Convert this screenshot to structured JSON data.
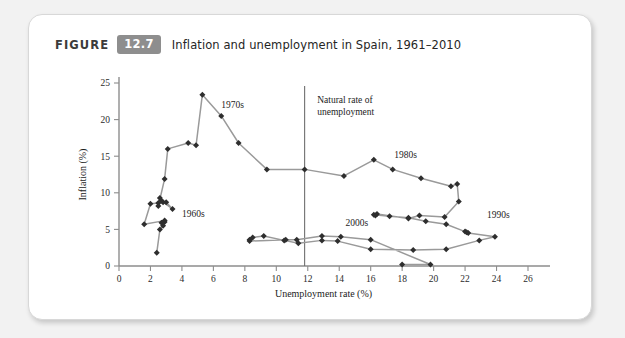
{
  "caption": {
    "figure_word": "FIGURE",
    "figure_number": "12.7",
    "title": "Inflation and unemployment in Spain, 1961–2010"
  },
  "colors": {
    "card_background": "#ffffff",
    "page_background": "#f2f2f2",
    "badge": "#8e8e8e",
    "line": "#9a9a9a",
    "marker": "#2e2e2e",
    "axis": "#8d8d8d",
    "natural_rate_line": "#6f6f6f"
  },
  "chart_data": {
    "type": "line",
    "title": "Inflation and unemployment in Spain, 1961–2010",
    "xlabel": "Unemployment rate (%)",
    "ylabel": "Inflation (%)",
    "xlim": [
      0,
      26
    ],
    "ylim": [
      0,
      25
    ],
    "xticks": [
      0,
      2,
      4,
      6,
      8,
      10,
      12,
      14,
      16,
      18,
      20,
      22,
      24,
      26
    ],
    "yticks": [
      0,
      5,
      10,
      15,
      20,
      25
    ],
    "grid": false,
    "legend": "none",
    "annotations": [
      {
        "text": "1970s",
        "x": 6.5,
        "y": 21.6
      },
      {
        "text": "Natural rate of",
        "x": 12.6,
        "y": 22.2
      },
      {
        "text": "unemployment",
        "x": 12.6,
        "y": 20.6
      },
      {
        "text": "1960s",
        "x": 4.0,
        "y": 6.7
      },
      {
        "text": "1980s",
        "x": 17.5,
        "y": 14.8
      },
      {
        "text": "1990s",
        "x": 23.4,
        "y": 6.5
      },
      {
        "text": "2000s",
        "x": 14.4,
        "y": 5.4
      }
    ],
    "natural_rate": {
      "x": 11.8,
      "label": "Natural rate of unemployment"
    },
    "series": [
      {
        "name": "Spain inflation vs unemployment, 1961-2010",
        "points": [
          [
            2.4,
            1.8
          ],
          [
            2.6,
            5.0
          ],
          [
            2.8,
            5.5
          ],
          [
            2.7,
            5.9
          ],
          [
            2.9,
            6.0
          ],
          [
            2.9,
            6.2
          ],
          [
            1.6,
            5.7
          ],
          [
            2.0,
            8.5
          ],
          [
            2.5,
            8.6
          ],
          [
            2.6,
            9.3
          ],
          [
            2.8,
            8.7
          ],
          [
            3.0,
            8.7
          ],
          [
            3.4,
            7.8
          ],
          [
            2.7,
            8.9
          ],
          [
            2.5,
            8.2
          ],
          [
            2.9,
            11.9
          ],
          [
            3.1,
            16.0
          ],
          [
            4.4,
            16.8
          ],
          [
            4.9,
            16.5
          ],
          [
            5.3,
            23.4
          ],
          [
            6.5,
            20.5
          ],
          [
            7.6,
            16.8
          ],
          [
            9.4,
            13.2
          ],
          [
            11.8,
            13.2
          ],
          [
            14.3,
            12.3
          ],
          [
            16.2,
            14.5
          ],
          [
            17.4,
            13.2
          ],
          [
            19.2,
            12.0
          ],
          [
            21.1,
            10.9
          ],
          [
            21.5,
            11.2
          ],
          [
            21.6,
            8.8
          ],
          [
            20.7,
            6.7
          ],
          [
            19.1,
            6.9
          ],
          [
            18.4,
            6.5
          ],
          [
            16.4,
            7.1
          ],
          [
            16.3,
            6.9
          ],
          [
            16.2,
            7.0
          ],
          [
            17.2,
            6.8
          ],
          [
            18.4,
            6.6
          ],
          [
            19.5,
            6.1
          ],
          [
            20.8,
            5.7
          ],
          [
            22.0,
            4.7
          ],
          [
            22.1,
            4.6
          ],
          [
            22.2,
            4.5
          ],
          [
            23.9,
            4.0
          ],
          [
            22.9,
            3.5
          ],
          [
            20.8,
            2.3
          ],
          [
            18.7,
            2.2
          ],
          [
            16.0,
            2.3
          ],
          [
            13.9,
            3.4
          ],
          [
            12.9,
            3.5
          ],
          [
            11.4,
            3.1
          ],
          [
            10.5,
            3.5
          ],
          [
            9.2,
            4.1
          ],
          [
            8.5,
            3.9
          ],
          [
            8.3,
            3.6
          ],
          [
            8.3,
            3.4
          ],
          [
            10.6,
            3.6
          ],
          [
            11.3,
            3.6
          ],
          [
            12.9,
            4.1
          ],
          [
            14.1,
            4.0
          ],
          [
            16.0,
            3.6
          ],
          [
            19.8,
            0.2
          ],
          [
            18.0,
            0.2
          ]
        ]
      }
    ]
  }
}
